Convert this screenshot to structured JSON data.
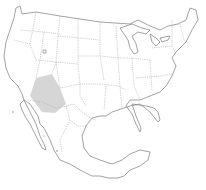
{
  "map": {
    "type": "outline-map",
    "extent": [
      "United States (contiguous)",
      "Mexico"
    ],
    "highlighted_region": {
      "label": "Sonoran Desert region (Arizona / Sonora)",
      "color": "#cfcfcf"
    },
    "line_color": "#8a8a8a",
    "background": "#ffffff"
  }
}
